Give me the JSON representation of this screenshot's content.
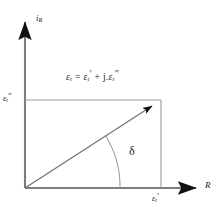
{
  "figure": {
    "type": "phasor-diagram",
    "title_text": "",
    "background_color": "#ffffff",
    "line_color": "#4a4a4a",
    "text_color": "#1a1a1a"
  },
  "axes": {
    "vertical": {
      "name": "imaginary-axis",
      "label_main": "i",
      "label_sub": "R",
      "label_full": "i_R",
      "arrow": "up"
    },
    "horizontal": {
      "name": "real-axis",
      "label_main": "R",
      "label_full": "R",
      "arrow": "right"
    }
  },
  "equation": {
    "lhs_symbol": "ε",
    "lhs_sub": "r",
    "equals": "=",
    "term1_symbol": "ε",
    "term1_sub": "r",
    "term1_prime": "′",
    "plus": "+",
    "j_symbol": "j",
    "dot": ".",
    "term2_symbol": "ε",
    "term2_sub": "r",
    "term2_prime": "″",
    "full_text": "εr = εr′ + j.εr″"
  },
  "tick_labels": {
    "y_axis": {
      "symbol": "ε",
      "sub": "r",
      "prime": "″",
      "full_text": "εr″"
    },
    "x_axis": {
      "symbol": "ε",
      "sub": "r",
      "prime": "′",
      "full_text": "εr′"
    }
  },
  "angle": {
    "symbol": "δ",
    "name": "loss-angle-delta"
  },
  "geometry": {
    "origin_x": 25,
    "origin_y": 188,
    "x_axis_end": 206,
    "y_axis_top": 14,
    "vector_tip_x": 161,
    "vector_tip_y": 100,
    "arc_radius": 95
  }
}
